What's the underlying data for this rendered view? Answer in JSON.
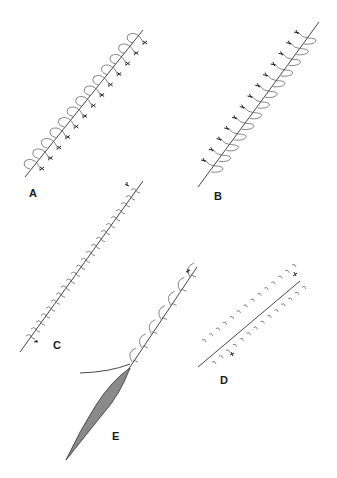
{
  "figure": {
    "panels": [
      {
        "label": "A",
        "technique": "simple running (continuous) suture with knots",
        "stitch_count": 13
      },
      {
        "label": "B",
        "technique": "running locked suture with loops",
        "stitch_count": 13
      },
      {
        "label": "C",
        "technique": "simple continuous suture with end knots",
        "stitch_count": 22
      },
      {
        "label": "D",
        "technique": "subcuticular / interrupted bites on both sides of incision",
        "stitch_count": 28
      },
      {
        "label": "E",
        "technique": "running locked suture with needle and thread",
        "stitch_count": 7
      }
    ]
  },
  "colors": {
    "line": "#333333",
    "fill_shading": "#888888",
    "background": "#ffffff"
  }
}
